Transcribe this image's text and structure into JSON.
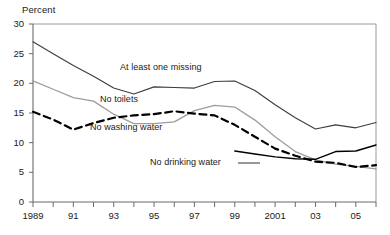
{
  "chart_data": {
    "type": "line",
    "title": "",
    "ylabel": "Percent",
    "xlabel": "",
    "ylim": [
      0,
      30
    ],
    "ytick_values": [
      0,
      5,
      10,
      15,
      20,
      25,
      30
    ],
    "ytick_labels": [
      "0",
      "5",
      "10",
      "15",
      "20",
      "25",
      "30"
    ],
    "xlim": [
      1989,
      2006
    ],
    "xtick_values": [
      1989,
      1990,
      1991,
      1992,
      1993,
      1994,
      1995,
      1996,
      1997,
      1998,
      1999,
      2000,
      2001,
      2002,
      2003,
      2004,
      2005,
      2006
    ],
    "xtick_labels": [
      "1989",
      "",
      "91",
      "",
      "93",
      "",
      "95",
      "",
      "97",
      "",
      "99",
      "",
      "2001",
      "",
      "03",
      "",
      "05",
      ""
    ],
    "grid": false,
    "legend_position": "inline-annotations",
    "x": [
      1989,
      1990,
      1991,
      1992,
      1993,
      1994,
      1995,
      1996,
      1997,
      1998,
      1999,
      2000,
      2001,
      2002,
      2003,
      2004,
      2005,
      2006
    ],
    "series": [
      {
        "name": "At least one missing",
        "color": "#3d3d3d",
        "style": "solid",
        "width": 1.1,
        "values": [
          27.0,
          25.0,
          23.0,
          21.2,
          19.2,
          18.2,
          19.4,
          19.3,
          19.2,
          20.3,
          20.4,
          18.8,
          16.4,
          14.2,
          12.3,
          13.0,
          12.5,
          13.4
        ]
      },
      {
        "name": "No toilets",
        "color": "#9c9c9c",
        "style": "solid",
        "width": 1.3,
        "values": [
          20.4,
          19.0,
          17.6,
          17.0,
          14.8,
          13.2,
          13.2,
          13.5,
          15.4,
          16.3,
          16.0,
          13.8,
          11.0,
          8.5,
          7.1,
          6.4,
          6.0,
          5.6
        ]
      },
      {
        "name": "No washing water",
        "color": "#000000",
        "style": "dashed",
        "width": 2.2,
        "values": [
          15.2,
          13.9,
          12.2,
          13.3,
          14.2,
          14.6,
          14.8,
          15.3,
          14.9,
          14.6,
          13.0,
          11.0,
          9.0,
          7.8,
          6.8,
          6.6,
          5.9,
          6.2
        ]
      },
      {
        "name": "No drinking water",
        "color": "#000000",
        "style": "solid",
        "width": 1.4,
        "values": [
          null,
          null,
          null,
          null,
          null,
          null,
          null,
          null,
          null,
          null,
          8.6,
          8.1,
          7.6,
          7.3,
          7.2,
          8.5,
          8.6,
          9.6
        ]
      }
    ],
    "annotations": [
      {
        "id": "at-least-one-missing",
        "text": "At least one missing",
        "x_px": 120,
        "y_px": 62,
        "leader": false
      },
      {
        "id": "no-toilets",
        "text": "No toilets",
        "x_px": 100,
        "y_px": 94,
        "leader": false
      },
      {
        "id": "no-washing-water",
        "text": "No washing water",
        "x_px": 90,
        "y_px": 122,
        "leader": false
      },
      {
        "id": "no-drinking-water",
        "text": "No drinking water",
        "x_px": 150,
        "y_px": 157,
        "leader": true
      }
    ]
  },
  "axes": {
    "y_title": "Percent"
  }
}
